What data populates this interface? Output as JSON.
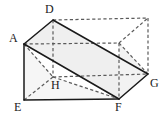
{
  "figure": {
    "type": "geometry-diagram",
    "canvas": {
      "width": 164,
      "height": 119,
      "background": "#ffffff"
    },
    "colors": {
      "solid_edge": "#1a1a1a",
      "hidden_edge": "#5a5a5a",
      "face_fill_light": "#f4f4f4",
      "face_fill_mid": "#ececec",
      "label_text": "#1a1a1a"
    },
    "vertices": [
      {
        "id": "A",
        "label": "A",
        "x": 24,
        "y": 44,
        "visible": true,
        "label_x": 9,
        "label_y": 32
      },
      {
        "id": "D",
        "label": "D",
        "x": 53,
        "y": 20,
        "visible": true,
        "label_x": 45,
        "label_y": 3
      },
      {
        "id": "E",
        "label": "E",
        "x": 24,
        "y": 100,
        "visible": true,
        "label_x": 14,
        "label_y": 101
      },
      {
        "id": "F",
        "label": "F",
        "x": 119,
        "y": 99,
        "visible": true,
        "label_x": 115,
        "label_y": 101
      },
      {
        "id": "G",
        "label": "G",
        "x": 148,
        "y": 74,
        "visible": true,
        "label_x": 150,
        "label_y": 77
      },
      {
        "id": "H",
        "label": "H",
        "x": 53,
        "y": 77,
        "visible": false,
        "label_x": 51,
        "label_y": 79
      },
      {
        "id": "B",
        "label": "",
        "x": 119,
        "y": 43,
        "visible": false,
        "label_x": 0,
        "label_y": 0
      },
      {
        "id": "C",
        "label": "",
        "x": 148,
        "y": 18,
        "visible": false,
        "label_x": 0,
        "label_y": 0
      }
    ],
    "faces": [
      {
        "name": "front-left-triangle",
        "points": "24,44 24,100 53,77",
        "fill": "#f4f4f4"
      },
      {
        "name": "top-diagonal-plane",
        "points": "24,44 53,20 148,74 119,99",
        "fill": "#efefef"
      },
      {
        "name": "front-lower-quad",
        "points": "24,44 53,77 119,99 24,100",
        "fill": "#f6f6f6"
      },
      {
        "name": "right-end-triangle",
        "points": "119,99 148,74 119,43",
        "fill": "#f2f2f2"
      }
    ],
    "solid_edges": [
      {
        "name": "A-D",
        "d": "M24,44 L53,20"
      },
      {
        "name": "D-G",
        "d": "M53,20 L148,74"
      },
      {
        "name": "A-E",
        "d": "M24,44 L24,100"
      },
      {
        "name": "E-F",
        "d": "M24,100 L119,99"
      },
      {
        "name": "F-G",
        "d": "M119,99 L148,74"
      },
      {
        "name": "A-F",
        "d": "M24,44 L119,99"
      }
    ],
    "hidden_edges": [
      {
        "name": "D-H",
        "d": "M53,20 L53,77"
      },
      {
        "name": "A-H",
        "d": "M24,44 L53,77"
      },
      {
        "name": "H-E",
        "d": "M53,77 L24,100"
      },
      {
        "name": "H-G",
        "d": "M53,77 L148,74"
      },
      {
        "name": "H-F",
        "d": "M53,77 L119,99"
      },
      {
        "name": "D-C",
        "d": "M53,20 L148,18"
      },
      {
        "name": "C-G",
        "d": "M148,18 L148,74"
      },
      {
        "name": "B-C",
        "d": "M119,43 L148,18"
      },
      {
        "name": "B-G",
        "d": "M119,43 L148,74"
      },
      {
        "name": "A-B",
        "d": "M24,44 L119,43"
      },
      {
        "name": "B-F",
        "d": "M119,43 L119,99"
      }
    ]
  }
}
